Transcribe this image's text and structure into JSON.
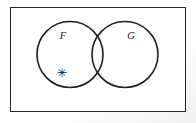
{
  "figure": {
    "kind": "venn-diagram",
    "width": 196,
    "height": 123,
    "background_color": "#ffffff",
    "stroke_color": "#1d1e22"
  },
  "universe": {
    "name": "universal-set-rectangle",
    "label": "",
    "x": 10,
    "y": 7,
    "width": 176,
    "height": 105,
    "border_color": "#26272b",
    "border_width": 1.5,
    "fill": "#ffffff"
  },
  "sets": [
    {
      "id": "F",
      "label": "F",
      "cx": 70,
      "cy": 54.5,
      "r": 33,
      "label_x": 63,
      "label_y": 39,
      "stroke": "#1d1e22"
    },
    {
      "id": "G",
      "label": "G",
      "cx": 125,
      "cy": 54.5,
      "r": 33,
      "label_x": 131,
      "label_y": 39,
      "stroke": "#1d1e22"
    }
  ],
  "elements": [
    {
      "id": "point-asterisk",
      "glyph": "✳",
      "label": "*",
      "x": 62,
      "y": 76,
      "region": "F-only",
      "description": "asterisk point marker located inside set F and outside set G"
    }
  ],
  "regions": {
    "intersection_label": "",
    "f_only_label": "",
    "g_only_label": "",
    "outside_label": ""
  }
}
